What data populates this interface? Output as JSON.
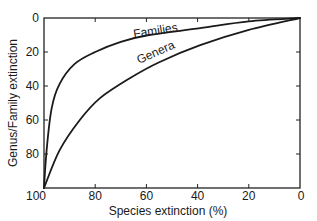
{
  "chart_data": {
    "type": "line",
    "title": "",
    "xlabel": "Species extinction (%)",
    "ylabel": "Genus/Family extinction",
    "xlim": [
      100,
      0
    ],
    "ylim": [
      100,
      0
    ],
    "x_reversed": true,
    "y_reversed": true,
    "xticks": [
      100,
      80,
      60,
      40,
      20,
      0
    ],
    "yticks": [
      0,
      20,
      40,
      60,
      80,
      100
    ],
    "grid": false,
    "legend": "inline labels on curves",
    "series": [
      {
        "name": "Families",
        "x": [
          100,
          99,
          97,
          94,
          88,
          80,
          70,
          59,
          39,
          20,
          0
        ],
        "y": [
          100,
          78,
          53,
          39,
          27,
          20,
          14,
          10,
          6,
          2,
          0
        ]
      },
      {
        "name": "Genera",
        "x": [
          100,
          94,
          86,
          78,
          66,
          55,
          39,
          20,
          0
        ],
        "y": [
          100,
          78,
          60,
          47,
          35,
          26,
          16,
          7,
          0
        ]
      }
    ]
  },
  "labels": {
    "xlabel": "Species extinction (%)",
    "ylabel": "Genus/Family extinction",
    "families": "Families",
    "genera": "Genera",
    "xticks": [
      "100",
      "80",
      "60",
      "40",
      "20",
      "0"
    ],
    "yticks": [
      "0",
      "20",
      "40",
      "60",
      "80",
      "100"
    ]
  }
}
